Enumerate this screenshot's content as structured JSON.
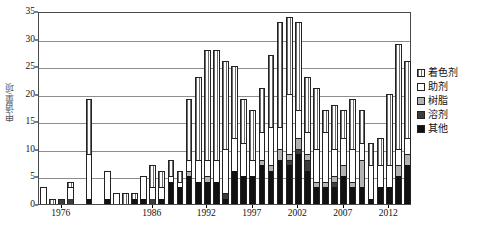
{
  "chart_data": {
    "type": "bar",
    "subtype": "stacked",
    "title": "",
    "xlabel": "",
    "ylabel": "申请量/项",
    "ylim": [
      0,
      35
    ],
    "ytick_step": 5,
    "yticks": [
      "0",
      "5",
      "10",
      "15",
      "20",
      "25",
      "30",
      "35"
    ],
    "grid": true,
    "grid_axis": "y",
    "legend_position": "right",
    "xtick_labels": [
      "1976",
      "1986",
      "1992",
      "1997",
      "2002",
      "2007",
      "2012"
    ],
    "xtick_years": [
      1976,
      1986,
      1992,
      1997,
      2002,
      2007,
      2012
    ],
    "x_start_year": 1974,
    "x_end_year": 2014,
    "categories": [
      1974,
      1975,
      1976,
      1977,
      1978,
      1979,
      1980,
      1981,
      1982,
      1983,
      1984,
      1985,
      1986,
      1987,
      1988,
      1989,
      1990,
      1991,
      1992,
      1993,
      1994,
      1995,
      1996,
      1997,
      1998,
      1999,
      2000,
      2001,
      2002,
      2003,
      2004,
      2005,
      2006,
      2007,
      2008,
      2009,
      2010,
      2011,
      2012,
      2013,
      2014
    ],
    "series": [
      {
        "name": "其他",
        "key": "other",
        "color": "#111111",
        "pattern": "solid-black",
        "values": [
          0,
          0,
          0,
          0,
          0,
          1,
          0,
          1,
          0,
          0,
          1,
          1,
          0,
          1,
          4,
          3,
          5,
          4,
          4,
          4,
          1,
          6,
          5,
          5,
          7,
          6,
          8,
          7,
          9,
          6,
          3,
          3,
          3,
          5,
          3,
          3,
          1,
          3,
          3,
          5,
          7
        ]
      },
      {
        "name": "溶剂",
        "key": "solvent",
        "color": "#3c3c3c",
        "pattern": "solid-darkgray",
        "values": [
          0,
          0,
          1,
          1,
          0,
          0,
          0,
          0,
          0,
          0,
          0,
          0,
          1,
          0,
          0,
          0,
          0,
          0,
          0,
          0,
          1,
          0,
          0,
          0,
          0,
          0,
          0,
          1,
          1,
          2,
          0,
          0,
          1,
          0,
          0,
          0,
          0,
          0,
          0,
          0,
          0
        ]
      },
      {
        "name": "树脂",
        "key": "resin",
        "color": "#b3b3b3",
        "pattern": "solid-lightgray",
        "values": [
          0,
          0,
          0,
          0,
          0,
          0,
          0,
          0,
          0,
          0,
          0,
          0,
          0,
          0,
          0,
          0,
          1,
          0,
          1,
          0,
          0,
          0,
          0,
          0,
          1,
          1,
          2,
          1,
          2,
          1,
          1,
          1,
          1,
          2,
          1,
          5,
          0,
          0,
          0,
          2,
          2
        ]
      },
      {
        "name": "助剂",
        "key": "auxiliary",
        "color": "#ffffff",
        "pattern": "white",
        "values": [
          3,
          0,
          0,
          2,
          0,
          8,
          0,
          5,
          2,
          0,
          0,
          4,
          2,
          2,
          1,
          1,
          2,
          4,
          3,
          4,
          8,
          6,
          6,
          3,
          5,
          7,
          4,
          11,
          5,
          4,
          6,
          9,
          5,
          5,
          6,
          3,
          6,
          4,
          4,
          3,
          3
        ]
      },
      {
        "name": "着色剂",
        "key": "colorant",
        "color": "#ffffff",
        "pattern": "vertical-hatch",
        "values": [
          0,
          1,
          0,
          1,
          0,
          10,
          0,
          0,
          0,
          2,
          1,
          0,
          4,
          3,
          3,
          2,
          11,
          15,
          20,
          20,
          16,
          13,
          8,
          9,
          8,
          13,
          19,
          14,
          16,
          10,
          11,
          4,
          8,
          5,
          9,
          6,
          4,
          5,
          13,
          19,
          14
        ]
      }
    ],
    "totals": [
      3,
      1,
      1,
      4,
      0,
      19,
      0,
      7,
      2,
      2,
      2,
      5,
      7,
      6,
      8,
      6,
      19,
      23,
      28,
      28,
      26,
      25,
      19,
      17,
      21,
      27,
      33,
      34,
      33,
      23,
      21,
      17,
      18,
      17,
      19,
      17,
      11,
      12,
      20,
      29,
      26
    ]
  },
  "legend": {
    "items": [
      {
        "label": "着色剂",
        "swatch": "vertical-hatch"
      },
      {
        "label": "助剂",
        "swatch": "white"
      },
      {
        "label": "树脂",
        "swatch": "light-gray"
      },
      {
        "label": "溶剂",
        "swatch": "dark-gray"
      },
      {
        "label": "其他",
        "swatch": "black"
      }
    ]
  }
}
